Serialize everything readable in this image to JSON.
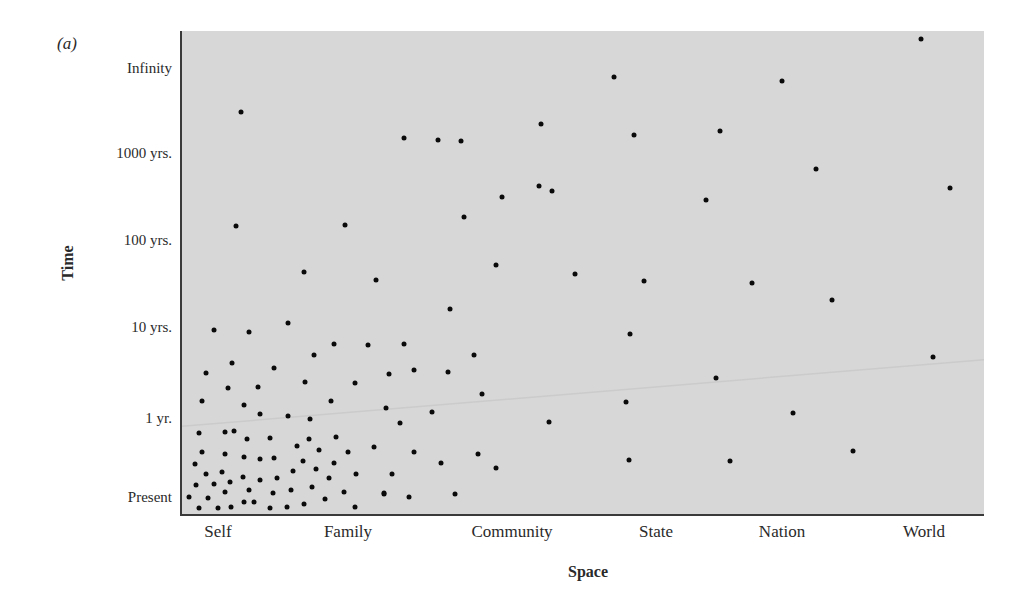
{
  "figure": {
    "panel_label": "(a)"
  },
  "chart_data": {
    "type": "scatter",
    "title": "",
    "panel": "(a)",
    "xlabel": "Space",
    "ylabel": "Time",
    "x_categories": [
      "Self",
      "Family",
      "Community",
      "State",
      "Nation",
      "World"
    ],
    "y_categories": [
      "Present",
      "1 yr.",
      "10 yrs.",
      "100 yrs.",
      "1000 yrs.",
      "Infinity"
    ],
    "x_scale_note": "x positions expressed on category index scale: Self=1 ... World=6",
    "y_scale_note": "y positions expressed on level index scale: Present=0, 1 yr.=1, 10 yrs.=2, 100 yrs.=3, 1000 yrs.=4, Infinity=5",
    "grid": false,
    "legend": null,
    "background_color": "#d7d7d7",
    "point_color": "#0a0a0a",
    "points": [
      [
        0.85,
        0.81
      ],
      [
        1.05,
        0.82
      ],
      [
        1.12,
        0.84
      ],
      [
        1.22,
        0.73
      ],
      [
        1.4,
        0.75
      ],
      [
        0.88,
        0.57
      ],
      [
        1.05,
        0.54
      ],
      [
        1.2,
        0.51
      ],
      [
        1.32,
        0.48
      ],
      [
        1.43,
        0.49
      ],
      [
        0.82,
        0.42
      ],
      [
        0.91,
        0.29
      ],
      [
        1.03,
        0.32
      ],
      [
        1.19,
        0.25
      ],
      [
        1.32,
        0.22
      ],
      [
        1.45,
        0.24
      ],
      [
        0.83,
        0.15
      ],
      [
        0.97,
        0.16
      ],
      [
        1.09,
        0.19
      ],
      [
        1.24,
        0.09
      ],
      [
        1.05,
        0.06
      ],
      [
        1.42,
        0.05
      ],
      [
        0.78,
        0.0
      ],
      [
        0.92,
        -0.01
      ],
      [
        1.2,
        -0.06
      ],
      [
        1.28,
        -0.06
      ],
      [
        0.85,
        -0.14
      ],
      [
        1.0,
        -0.14
      ],
      [
        1.1,
        -0.13
      ],
      [
        1.4,
        -0.14
      ],
      [
        1.53,
        -0.13
      ],
      [
        1.7,
        0.73
      ],
      [
        1.91,
        0.76
      ],
      [
        1.61,
        0.65
      ],
      [
        1.78,
        0.59
      ],
      [
        2.0,
        0.57
      ],
      [
        2.16,
        0.63
      ],
      [
        1.65,
        0.46
      ],
      [
        1.89,
        0.43
      ],
      [
        1.58,
        0.33
      ],
      [
        1.75,
        0.35
      ],
      [
        2.05,
        0.29
      ],
      [
        1.85,
        0.24
      ],
      [
        1.56,
        0.09
      ],
      [
        1.72,
        0.13
      ],
      [
        1.97,
        0.06
      ],
      [
        2.22,
        0.05
      ],
      [
        1.82,
        -0.03
      ],
      [
        1.66,
        -0.09
      ],
      [
        2.04,
        -0.13
      ],
      [
        0.97,
        1.97
      ],
      [
        1.24,
        1.95
      ],
      [
        1.54,
        2.05
      ],
      [
        1.11,
        1.6
      ],
      [
        0.91,
        1.49
      ],
      [
        1.43,
        1.55
      ],
      [
        1.08,
        1.33
      ],
      [
        1.31,
        1.34
      ],
      [
        0.88,
        1.19
      ],
      [
        1.2,
        1.14
      ],
      [
        1.32,
        1.04
      ],
      [
        1.54,
        1.02
      ],
      [
        2.62,
        2.21
      ],
      [
        1.89,
        1.81
      ],
      [
        2.12,
        1.8
      ],
      [
        2.34,
        1.81
      ],
      [
        1.74,
        1.69
      ],
      [
        2.25,
        1.48
      ],
      [
        2.4,
        1.53
      ],
      [
        2.61,
        1.51
      ],
      [
        1.67,
        1.4
      ],
      [
        2.04,
        1.38
      ],
      [
        1.87,
        1.19
      ],
      [
        2.23,
        1.11
      ],
      [
        2.51,
        1.07
      ],
      [
        1.71,
        0.99
      ],
      [
        2.32,
        0.94
      ],
      [
        1.18,
        4.48
      ],
      [
        2.34,
        4.18
      ],
      [
        2.55,
        4.15
      ],
      [
        2.69,
        4.14
      ],
      [
        1.14,
        3.16
      ],
      [
        1.98,
        3.17
      ],
      [
        2.71,
        3.26
      ],
      [
        1.66,
        2.63
      ],
      [
        2.17,
        2.54
      ],
      [
        3.71,
        4.89
      ],
      [
        3.2,
        4.34
      ],
      [
        3.85,
        4.21
      ],
      [
        4.51,
        4.26
      ],
      [
        3.19,
        3.62
      ],
      [
        3.28,
        3.56
      ],
      [
        2.94,
        3.49
      ],
      [
        4.4,
        3.46
      ],
      [
        2.9,
        2.71
      ],
      [
        3.44,
        2.61
      ],
      [
        3.92,
        2.53
      ],
      [
        4.76,
        2.51
      ],
      [
        5.98,
        5.34
      ],
      [
        5.0,
        4.85
      ],
      [
        5.24,
        3.82
      ],
      [
        6.18,
        3.6
      ],
      [
        5.35,
        2.31
      ],
      [
        3.82,
        1.92
      ],
      [
        4.48,
        1.44
      ],
      [
        3.79,
        1.18
      ],
      [
        5.08,
        1.05
      ],
      [
        3.81,
        0.47
      ],
      [
        4.59,
        0.46
      ],
      [
        5.5,
        0.58
      ],
      [
        6.06,
        1.67
      ],
      [
        2.77,
        1.69
      ],
      [
        2.82,
        1.26
      ],
      [
        3.26,
        0.95
      ],
      [
        2.4,
        0.57
      ],
      [
        2.57,
        0.43
      ],
      [
        2.79,
        0.54
      ],
      [
        2.9,
        0.37
      ],
      [
        2.27,
        0.29
      ],
      [
        2.22,
        0.04
      ],
      [
        2.37,
        0.0
      ],
      [
        2.65,
        0.04
      ]
    ],
    "point_count": 122
  }
}
